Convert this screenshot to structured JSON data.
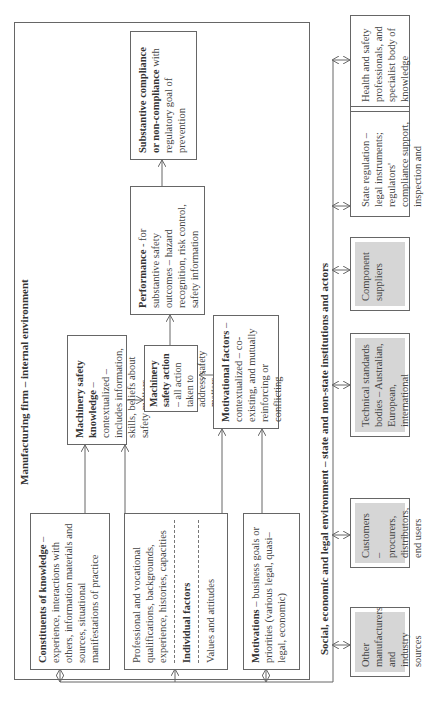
{
  "firm": {
    "title": "Manufacturing firm – internal environment",
    "constituents": {
      "bold": "Constituents of knowledge",
      "text": " – experience, interactions with others, information materials and sources, situational manifestations of practice"
    },
    "individual": {
      "top": "Professional and vocational qualifications, backgrounds, experience, histories, capacities",
      "bold": "Individual factors",
      "bottom": "Values and attitudes"
    },
    "motivations": {
      "bold": "Motivations",
      "text": " – business goals or priorities (various legal, quasi–legal, economic)"
    },
    "knowledge": {
      "bold": "Machinery safety knowledge",
      "text": " – contextualized – includes information, skills, beliefs about safety matters"
    },
    "action": {
      "bold": "Machinery safety action",
      "text": " – all action taken to address safety matters"
    },
    "motivational": {
      "bold": "Motivational factors",
      "text": " – contextualized – co-existing, and mutually reinforcing or conflicting"
    },
    "performance": {
      "bold": "Performance",
      "text": " - for substantive safety outcomes – hazard recognition, risk control, safety information"
    },
    "compliance": {
      "bold": "Substantive compliance or non-compliance",
      "text": " with regulatory goal of prevention"
    }
  },
  "environment": {
    "title": "Social, economic and legal environment – state and non-state institutions and actors",
    "actors": [
      {
        "label": "Other manufacturers and industry sources",
        "shaded": true
      },
      {
        "label": "Customers – procurers, distributors, end users",
        "shaded": true
      },
      {
        "label": "Technical standards bodies – Australian, European, international",
        "shaded": true
      },
      {
        "label": "Component suppliers",
        "shaded": true
      },
      {
        "label": "State regulation – legal instruments; regulators' compliance support, inspection and enforcement",
        "shaded": false
      },
      {
        "label": "Health and safety professionals, and specialist body of knowledge",
        "shaded": false
      }
    ]
  },
  "colors": {
    "line": "#666666",
    "shade": "#d6d6d6",
    "text": "#444444"
  }
}
